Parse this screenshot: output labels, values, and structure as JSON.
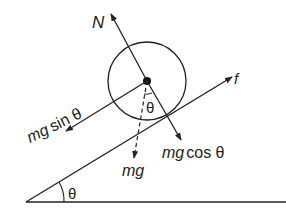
{
  "diagram": {
    "colors": {
      "stroke": "#222222",
      "background": "#ffffff"
    },
    "labels": {
      "normal": "N",
      "friction": "f",
      "mg_sin": "mg sin θ",
      "mg_cos": "mg cos θ",
      "mg": "mg",
      "theta_center": "θ",
      "theta_incline": "θ"
    },
    "label_parts": {
      "mg_sin_var": "mg",
      "mg_sin_fn": "sin θ",
      "mg_cos_var": "mg",
      "mg_cos_fn": "cos θ"
    }
  }
}
